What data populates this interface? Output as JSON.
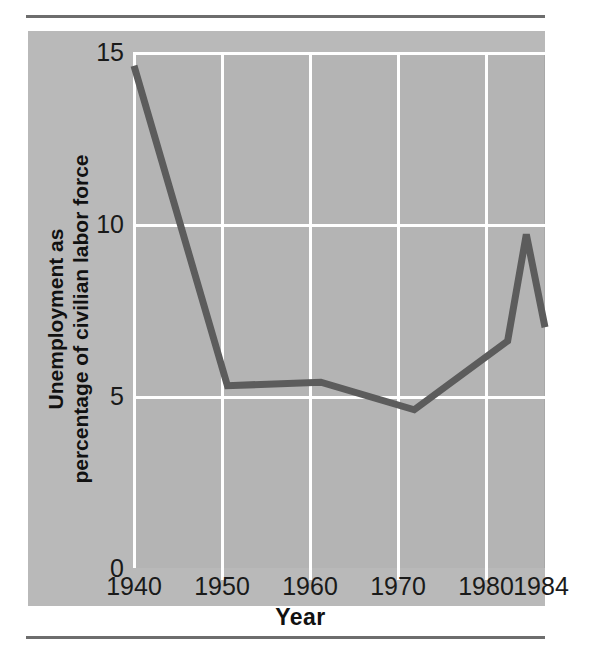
{
  "figure": {
    "panel_color": "#b9b9b9",
    "grid_color": "#ffffff",
    "line_color": "#5c5c5c",
    "rule_color": "#6d6d6d"
  },
  "axes": {
    "y_title": "Unemployment as\npercentage of civilian labor force",
    "x_title": "Year",
    "y_ticks": [
      "15",
      "10",
      "5",
      "0"
    ],
    "x_ticks": [
      "1940",
      "1950",
      "1960",
      "1970",
      "1980",
      "1984"
    ]
  },
  "chart_data": {
    "type": "line",
    "title": "",
    "xlabel": "Year",
    "ylabel": "Unemployment as percentage of civilian labor force",
    "x": [
      1940,
      1950,
      1960,
      1970,
      1980,
      1982,
      1984
    ],
    "values": [
      14.6,
      5.3,
      5.4,
      4.6,
      6.6,
      9.7,
      7.0
    ],
    "series": [
      {
        "name": "Unemployment rate",
        "values": [
          14.6,
          5.3,
          5.4,
          4.6,
          6.6,
          9.7,
          7.0
        ]
      }
    ],
    "xlim": [
      1940,
      1984
    ],
    "ylim": [
      0,
      15
    ],
    "y_tick_values": [
      15,
      10,
      5,
      0
    ],
    "x_tick_values": [
      1940,
      1950,
      1960,
      1970,
      1980,
      1984
    ],
    "grid": "both",
    "legend": "none"
  }
}
